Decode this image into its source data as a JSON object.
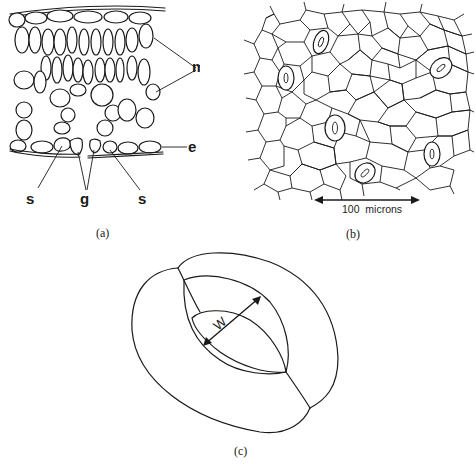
{
  "figure": {
    "panels": [
      {
        "id": "a",
        "caption": "(a)",
        "description": "leaf cross-section",
        "labels": {
          "m": "m",
          "e": "e",
          "s_left": "s",
          "g": "g",
          "s_right": "s"
        }
      },
      {
        "id": "b",
        "caption": "(b)",
        "description": "epidermis surface view with stomata",
        "scale_bar": "100  microns"
      },
      {
        "id": "c",
        "caption": "(c)",
        "description": "single stoma (guard cells)",
        "width_label": "W"
      }
    ]
  }
}
